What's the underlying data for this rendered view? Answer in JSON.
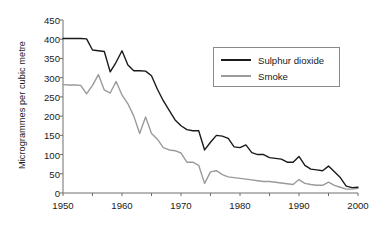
{
  "chart_data": {
    "type": "line",
    "title": "",
    "xlabel": "",
    "ylabel": "Microgrammes per cubic metre",
    "xlim": [
      1950,
      2000
    ],
    "ylim": [
      0,
      450
    ],
    "ytick_labels": [
      "0",
      "50",
      "100",
      "150",
      "200",
      "250",
      "300",
      "350",
      "400",
      "450"
    ],
    "ytick_values": [
      0,
      50,
      100,
      150,
      200,
      250,
      300,
      350,
      400,
      450
    ],
    "xtick_labels": [
      "1950",
      "1960",
      "1970",
      "1980",
      "1990",
      "2000"
    ],
    "xtick_values": [
      1950,
      1960,
      1970,
      1980,
      1990,
      2000
    ],
    "xminor_step": 5,
    "grid": false,
    "legend_position": "upper right",
    "x": [
      1950,
      1951,
      1952,
      1953,
      1954,
      1955,
      1956,
      1957,
      1958,
      1959,
      1960,
      1961,
      1962,
      1963,
      1964,
      1965,
      1966,
      1967,
      1968,
      1969,
      1970,
      1971,
      1972,
      1973,
      1974,
      1975,
      1976,
      1977,
      1978,
      1979,
      1980,
      1981,
      1982,
      1983,
      1984,
      1985,
      1986,
      1987,
      1988,
      1989,
      1990,
      1991,
      1992,
      1993,
      1994,
      1995,
      1996,
      1997,
      1998,
      1999,
      2000
    ],
    "series": [
      {
        "name": "Sulphur dioxide",
        "color": "#1a1a1a",
        "values": [
          402,
          402,
          402,
          402,
          401,
          372,
          370,
          368,
          315,
          340,
          370,
          333,
          318,
          318,
          317,
          305,
          270,
          240,
          215,
          190,
          175,
          165,
          162,
          162,
          112,
          132,
          150,
          148,
          142,
          120,
          118,
          125,
          105,
          100,
          100,
          92,
          90,
          88,
          80,
          80,
          95,
          72,
          62,
          60,
          58,
          70,
          55,
          40,
          18,
          14,
          15
        ]
      },
      {
        "name": "Smoke",
        "color": "#9a9a9a",
        "values": [
          282,
          281,
          281,
          280,
          258,
          280,
          308,
          268,
          260,
          290,
          255,
          232,
          200,
          155,
          198,
          155,
          140,
          118,
          112,
          110,
          104,
          80,
          80,
          72,
          25,
          55,
          58,
          48,
          42,
          40,
          38,
          36,
          34,
          32,
          30,
          30,
          28,
          26,
          24,
          22,
          35,
          25,
          22,
          20,
          20,
          28,
          20,
          15,
          10,
          10,
          12
        ]
      }
    ]
  },
  "legend": {
    "items": [
      {
        "label": "Sulphur dioxide",
        "color": "#1a1a1a"
      },
      {
        "label": "Smoke",
        "color": "#9a9a9a"
      }
    ]
  },
  "axes": {
    "axis_color": "#6e6e6e"
  }
}
